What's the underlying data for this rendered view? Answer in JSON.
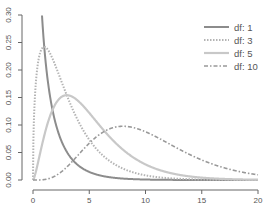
{
  "chart_data": {
    "type": "line",
    "title": "",
    "xlabel": "",
    "ylabel": "",
    "distribution": "chi-squared density",
    "xlim": [
      0,
      20
    ],
    "ylim": [
      0,
      0.3
    ],
    "x_ticks": [
      0,
      5,
      10,
      15,
      20
    ],
    "x_tick_labels": [
      "0",
      "5",
      "10",
      "15",
      "20"
    ],
    "y_ticks": [
      0.0,
      0.05,
      0.1,
      0.15,
      0.2,
      0.25,
      0.3
    ],
    "y_tick_labels": [
      "0.00",
      "0.05",
      "0.10",
      "0.15",
      "0.20",
      "0.25",
      "0.30"
    ],
    "grid": false,
    "legend_position": "top-right",
    "series": [
      {
        "name": "df: 1",
        "df": 1,
        "color": "#8c8c8c",
        "dash": "solid",
        "peak": {
          "x": 0.3,
          "y": 0.3
        }
      },
      {
        "name": "df: 3",
        "df": 3,
        "color": "#b4b4b4",
        "dash": "dotted",
        "peak": {
          "x": 1,
          "y": 0.24
        }
      },
      {
        "name": "df: 5",
        "df": 5,
        "color": "#c8c8c8",
        "dash": "solid",
        "peak": {
          "x": 3,
          "y": 0.154
        }
      },
      {
        "name": "df: 10",
        "df": 10,
        "color": "#999999",
        "dash": "dashdot",
        "peak": {
          "x": 8,
          "y": 0.098
        }
      }
    ]
  }
}
